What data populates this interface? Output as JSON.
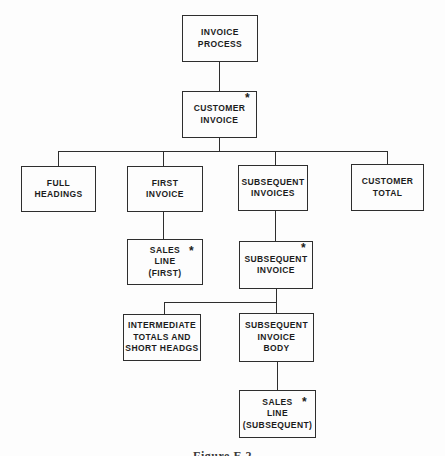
{
  "figure": {
    "caption": "Figure E.2"
  },
  "colors": {
    "ink": "#2e2e2e",
    "paper": "#fdfdfd"
  },
  "nodes": {
    "invoice_process": {
      "lines": [
        "INVOICE",
        "PROCESS"
      ]
    },
    "customer_invoice": {
      "lines": [
        "CUSTOMER",
        "INVOICE"
      ],
      "marker": "*"
    },
    "full_headings": {
      "lines": [
        "FULL",
        "HEADINGS"
      ]
    },
    "first_invoice": {
      "lines": [
        "FIRST",
        "INVOICE"
      ]
    },
    "subsequent_invoices": {
      "lines": [
        "SUBSEQUENT",
        "INVOICES"
      ]
    },
    "customer_total": {
      "lines": [
        "CUSTOMER",
        "TOTAL"
      ]
    },
    "sales_line_first": {
      "lines": [
        "SALES",
        "LINE",
        "(FIRST)"
      ],
      "marker": "*"
    },
    "subsequent_invoice": {
      "lines": [
        "SUBSEQUENT",
        "INVOICE"
      ],
      "marker": "*"
    },
    "intermediate_totals": {
      "lines": [
        "INTERMEDIATE",
        "TOTALS AND",
        "SHORT HEADGS"
      ]
    },
    "subsequent_invoice_body": {
      "lines": [
        "SUBSEQUENT",
        "INVOICE",
        "BODY"
      ]
    },
    "sales_line_subsequent": {
      "lines": [
        "SALES",
        "LINE",
        "(SUBSEQUENT)"
      ],
      "marker": "*"
    }
  }
}
